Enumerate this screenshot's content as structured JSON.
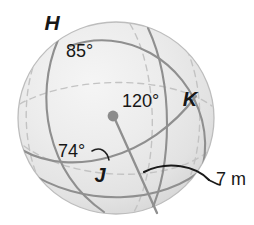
{
  "figure": {
    "kind": "sphere-with-great-circles",
    "background_color": "#ffffff",
    "sphere": {
      "fill_light": "#f2f2f2",
      "fill_mid": "#e6e6e6",
      "fill_dark": "#d4d4d4",
      "outline_color": "#b9b9b9",
      "center_dot_color": "#8c8c8c",
      "arc_color": "#8f8f8f",
      "hidden_arc_color": "#bcbcbc",
      "measure_arc_color": "#1a1a1a",
      "radius_line_color": "#8f8f8f"
    },
    "points": [
      {
        "id": "point-h",
        "label": "H",
        "x": 52,
        "y": 30
      },
      {
        "id": "point-k",
        "label": "K",
        "x": 190,
        "y": 106
      },
      {
        "id": "point-j",
        "label": "J",
        "x": 100,
        "y": 182
      }
    ],
    "measures": [
      {
        "id": "angle-85",
        "label": "85°",
        "x": 66,
        "y": 57
      },
      {
        "id": "angle-120",
        "label": "120°",
        "x": 122,
        "y": 107
      },
      {
        "id": "angle-74",
        "label": "74°",
        "x": 58,
        "y": 157
      },
      {
        "id": "radius-7m",
        "label": "7 m",
        "x": 216,
        "y": 185
      }
    ]
  }
}
